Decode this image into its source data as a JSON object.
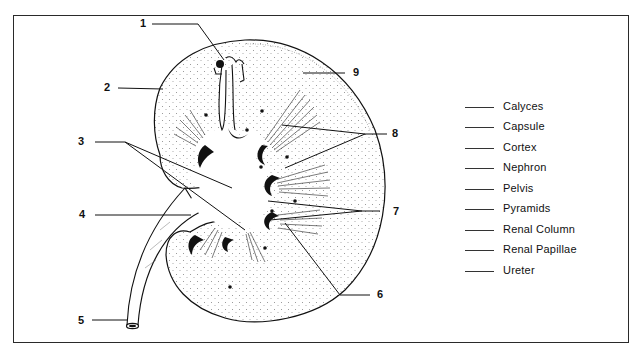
{
  "diagram": {
    "callout_numbers": [
      "1",
      "2",
      "3",
      "4",
      "5",
      "6",
      "7",
      "8",
      "9"
    ],
    "legend": {
      "items": [
        {
          "blank": "_____",
          "label": "Calyces"
        },
        {
          "blank": "_____",
          "label": "Capsule"
        },
        {
          "blank": "_____",
          "label": "Cortex"
        },
        {
          "blank": "_____",
          "label": "Nephron"
        },
        {
          "blank": "_____",
          "label": "Pelvis"
        },
        {
          "blank": "_____",
          "label": "Pyramids"
        },
        {
          "blank": "_____",
          "label": "Renal Column"
        },
        {
          "blank": "_____",
          "label": "Renal Papillae"
        },
        {
          "blank": "_____",
          "label": "Ureter"
        }
      ]
    },
    "colors": {
      "ink": "#111111",
      "paper": "#ffffff",
      "border": "#2a2a2a"
    }
  }
}
